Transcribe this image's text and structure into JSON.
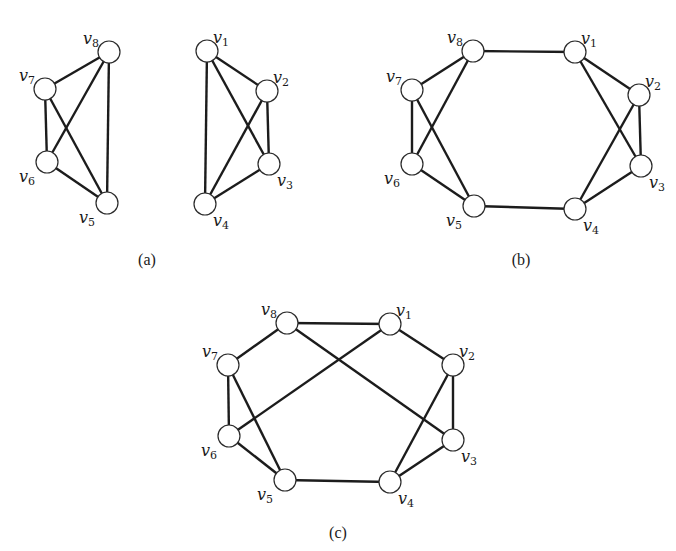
{
  "figure": {
    "panels": [
      {
        "id": "a",
        "caption": "(a)",
        "vertices": [
          {
            "id": "v1",
            "name": "v",
            "sub": "1"
          },
          {
            "id": "v2",
            "name": "v",
            "sub": "2"
          },
          {
            "id": "v3",
            "name": "v",
            "sub": "3"
          },
          {
            "id": "v4",
            "name": "v",
            "sub": "4"
          },
          {
            "id": "v5",
            "name": "v",
            "sub": "5"
          },
          {
            "id": "v6",
            "name": "v",
            "sub": "6"
          },
          {
            "id": "v7",
            "name": "v",
            "sub": "7"
          },
          {
            "id": "v8",
            "name": "v",
            "sub": "8"
          }
        ],
        "edges": [
          [
            "v8",
            "v7"
          ],
          [
            "v8",
            "v6"
          ],
          [
            "v8",
            "v5"
          ],
          [
            "v7",
            "v6"
          ],
          [
            "v7",
            "v5"
          ],
          [
            "v6",
            "v5"
          ],
          [
            "v1",
            "v2"
          ],
          [
            "v1",
            "v3"
          ],
          [
            "v1",
            "v4"
          ],
          [
            "v2",
            "v3"
          ],
          [
            "v2",
            "v4"
          ],
          [
            "v3",
            "v4"
          ]
        ]
      },
      {
        "id": "b",
        "caption": "(b)",
        "vertices": [
          {
            "id": "v1",
            "name": "v",
            "sub": "1"
          },
          {
            "id": "v2",
            "name": "v",
            "sub": "2"
          },
          {
            "id": "v3",
            "name": "v",
            "sub": "3"
          },
          {
            "id": "v4",
            "name": "v",
            "sub": "4"
          },
          {
            "id": "v5",
            "name": "v",
            "sub": "5"
          },
          {
            "id": "v6",
            "name": "v",
            "sub": "6"
          },
          {
            "id": "v7",
            "name": "v",
            "sub": "7"
          },
          {
            "id": "v8",
            "name": "v",
            "sub": "8"
          }
        ],
        "edges": [
          [
            "v8",
            "v1"
          ],
          [
            "v5",
            "v4"
          ],
          [
            "v8",
            "v7"
          ],
          [
            "v8",
            "v6"
          ],
          [
            "v7",
            "v6"
          ],
          [
            "v7",
            "v5"
          ],
          [
            "v6",
            "v5"
          ],
          [
            "v1",
            "v2"
          ],
          [
            "v1",
            "v3"
          ],
          [
            "v2",
            "v3"
          ],
          [
            "v2",
            "v4"
          ],
          [
            "v3",
            "v4"
          ]
        ]
      },
      {
        "id": "c",
        "caption": "(c)",
        "vertices": [
          {
            "id": "v1",
            "name": "v",
            "sub": "1"
          },
          {
            "id": "v2",
            "name": "v",
            "sub": "2"
          },
          {
            "id": "v3",
            "name": "v",
            "sub": "3"
          },
          {
            "id": "v4",
            "name": "v",
            "sub": "4"
          },
          {
            "id": "v5",
            "name": "v",
            "sub": "5"
          },
          {
            "id": "v6",
            "name": "v",
            "sub": "6"
          },
          {
            "id": "v7",
            "name": "v",
            "sub": "7"
          },
          {
            "id": "v8",
            "name": "v",
            "sub": "8"
          }
        ],
        "edges": [
          [
            "v8",
            "v1"
          ],
          [
            "v5",
            "v4"
          ],
          [
            "v8",
            "v7"
          ],
          [
            "v8",
            "v3"
          ],
          [
            "v1",
            "v6"
          ],
          [
            "v1",
            "v2"
          ],
          [
            "v7",
            "v6"
          ],
          [
            "v7",
            "v5"
          ],
          [
            "v6",
            "v5"
          ],
          [
            "v2",
            "v3"
          ],
          [
            "v2",
            "v4"
          ],
          [
            "v3",
            "v4"
          ]
        ]
      }
    ]
  }
}
